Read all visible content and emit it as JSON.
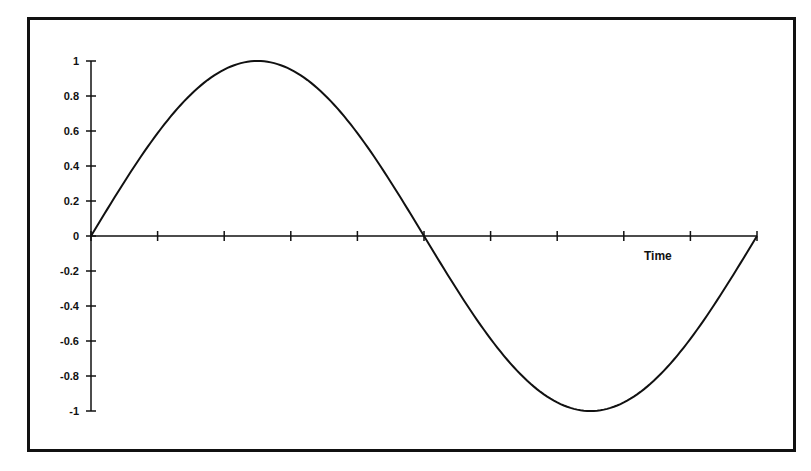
{
  "chart_data": {
    "type": "line",
    "title": "",
    "xlabel": "Time",
    "ylabel": "",
    "ylim": [
      -1,
      1
    ],
    "xlim": [
      0,
      10
    ],
    "y_ticks": [
      "1",
      "0.8",
      "0.6",
      "0.4",
      "0.2",
      "0",
      "-0.2",
      "-0.4",
      "-0.6",
      "-0.8",
      "-1"
    ],
    "x_ticks_count": 11,
    "x_tick_labels": [],
    "grid": false,
    "legend": null,
    "series": [
      {
        "name": "sine wave",
        "description": "One full period of a sine wave: starts at 0, peaks at 1, crosses 0 at midpoint, troughs at -1, returns to 0",
        "x": [
          0,
          0.5,
          1,
          1.5,
          2,
          2.5,
          3,
          3.5,
          4,
          4.5,
          5,
          5.5,
          6,
          6.5,
          7,
          7.5,
          8,
          8.5,
          9,
          9.5,
          10
        ],
        "values": [
          0,
          0.31,
          0.59,
          0.81,
          0.95,
          1.0,
          0.95,
          0.81,
          0.59,
          0.31,
          0,
          -0.31,
          -0.59,
          -0.81,
          -0.95,
          -1.0,
          -0.95,
          -0.81,
          -0.59,
          -0.31,
          0
        ]
      }
    ],
    "colors": {
      "line": "#111111",
      "axes": "#111111",
      "frame": "#111111",
      "background": "#ffffff"
    }
  }
}
